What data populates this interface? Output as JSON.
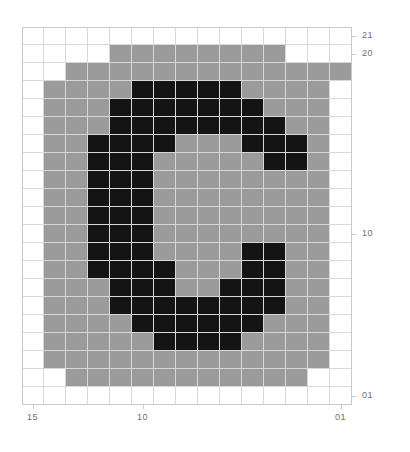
{
  "chart_data": {
    "type": "heatmap",
    "title": "",
    "xlabel": "",
    "ylabel": "",
    "grid": true,
    "legend": "none",
    "rows": 21,
    "cols": 15,
    "x_axis": {
      "direction": "descending",
      "ticks": [
        {
          "label": "15",
          "col": 1
        },
        {
          "label": "10",
          "col": 6
        },
        {
          "label": "01",
          "col": 15
        }
      ],
      "tick_labels": [
        "15",
        "10",
        "01"
      ]
    },
    "y_axis": {
      "direction": "descending",
      "ticks": [
        {
          "label": "21",
          "row": 1
        },
        {
          "label": "20",
          "row": 2
        },
        {
          "label": "10",
          "row": 12
        },
        {
          "label": "01",
          "row": 21
        }
      ],
      "tick_labels": [
        "21",
        "20",
        "10",
        "01"
      ]
    },
    "value_levels": [
      {
        "value": 0,
        "color": "#ffffff",
        "name": "empty"
      },
      {
        "value": 1,
        "color": "#9b9b9b",
        "name": "gray"
      },
      {
        "value": 2,
        "color": "#141414",
        "name": "black"
      }
    ],
    "matrix": [
      [
        0,
        0,
        0,
        0,
        0,
        0,
        0,
        0,
        0,
        0,
        0,
        0,
        0,
        0,
        0
      ],
      [
        0,
        0,
        0,
        0,
        1,
        1,
        1,
        1,
        1,
        1,
        1,
        1,
        0,
        0,
        0
      ],
      [
        0,
        0,
        1,
        1,
        1,
        1,
        1,
        1,
        1,
        1,
        1,
        1,
        1,
        1,
        1
      ],
      [
        0,
        1,
        1,
        1,
        1,
        2,
        2,
        2,
        2,
        2,
        1,
        1,
        1,
        1,
        0
      ],
      [
        0,
        1,
        1,
        1,
        2,
        2,
        2,
        2,
        2,
        2,
        2,
        1,
        1,
        1,
        0
      ],
      [
        0,
        1,
        1,
        1,
        2,
        2,
        2,
        2,
        2,
        2,
        2,
        2,
        1,
        1,
        0
      ],
      [
        0,
        1,
        1,
        2,
        2,
        2,
        2,
        1,
        1,
        1,
        2,
        2,
        2,
        1,
        0
      ],
      [
        0,
        1,
        1,
        2,
        2,
        2,
        1,
        1,
        1,
        1,
        1,
        2,
        2,
        1,
        0
      ],
      [
        0,
        1,
        1,
        2,
        2,
        2,
        1,
        1,
        1,
        1,
        1,
        1,
        1,
        1,
        0
      ],
      [
        0,
        1,
        1,
        2,
        2,
        2,
        1,
        1,
        1,
        1,
        1,
        1,
        1,
        1,
        0
      ],
      [
        0,
        1,
        1,
        2,
        2,
        2,
        1,
        1,
        1,
        1,
        1,
        1,
        1,
        1,
        0
      ],
      [
        0,
        1,
        1,
        2,
        2,
        2,
        1,
        1,
        1,
        1,
        1,
        1,
        1,
        1,
        0
      ],
      [
        0,
        1,
        1,
        2,
        2,
        2,
        1,
        1,
        1,
        1,
        2,
        2,
        1,
        1,
        0
      ],
      [
        0,
        1,
        1,
        2,
        2,
        2,
        2,
        1,
        1,
        1,
        2,
        2,
        1,
        1,
        0
      ],
      [
        0,
        1,
        1,
        1,
        2,
        2,
        2,
        1,
        1,
        2,
        2,
        2,
        1,
        1,
        0
      ],
      [
        0,
        1,
        1,
        1,
        2,
        2,
        2,
        2,
        2,
        2,
        2,
        2,
        1,
        1,
        0
      ],
      [
        0,
        1,
        1,
        1,
        1,
        2,
        2,
        2,
        2,
        2,
        2,
        1,
        1,
        1,
        0
      ],
      [
        0,
        1,
        1,
        1,
        1,
        1,
        2,
        2,
        2,
        2,
        1,
        1,
        1,
        1,
        0
      ],
      [
        0,
        1,
        1,
        1,
        1,
        1,
        1,
        1,
        1,
        1,
        1,
        1,
        1,
        1,
        0
      ],
      [
        0,
        0,
        1,
        1,
        1,
        1,
        1,
        1,
        1,
        1,
        1,
        1,
        1,
        0,
        0
      ],
      [
        0,
        0,
        0,
        0,
        0,
        0,
        0,
        0,
        0,
        0,
        0,
        0,
        0,
        0,
        0
      ]
    ]
  }
}
